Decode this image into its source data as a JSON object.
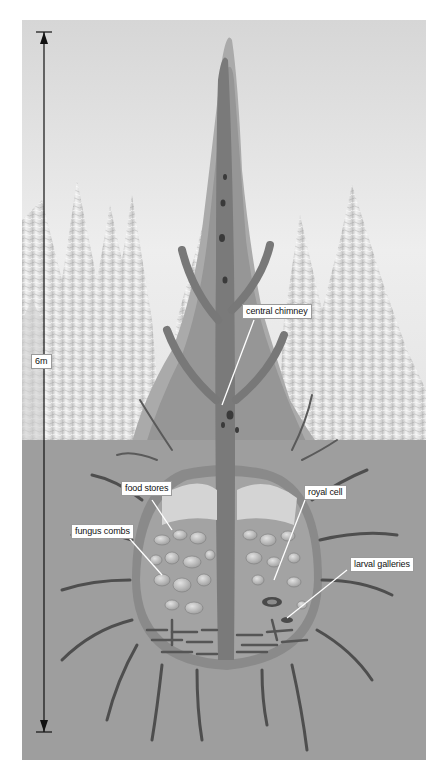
{
  "diagram": {
    "scale": {
      "label": "6m"
    },
    "labels": {
      "central_chimney": "central chimney",
      "food_stores": "food stores",
      "fungus_combs": "fungus combs",
      "royal_cell": "royal cell",
      "larval_galleries": "larval galleries"
    },
    "colors": {
      "sky_top": "#d9d9d9",
      "sky_bottom": "#f2f2f2",
      "ground": "#9e9e9e",
      "mound_outer": "#a8a8a8",
      "mound_inner": "#8e8e8e",
      "tunnel": "#5a5a5a",
      "comb": "#c8c8c8",
      "background_spires": "#e6e6e6"
    }
  }
}
